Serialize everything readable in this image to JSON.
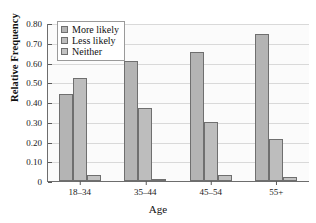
{
  "chart_data": {
    "type": "bar",
    "title": "",
    "xlabel": "Age",
    "ylabel": "Relative Frequency",
    "categories": [
      "18–34",
      "35–44",
      "45–54",
      "55+"
    ],
    "series": [
      {
        "name": "More likely",
        "values": [
          0.44,
          0.61,
          0.655,
          0.745
        ],
        "color": "#b4b4b4"
      },
      {
        "name": "Less likely",
        "values": [
          0.52,
          0.37,
          0.3,
          0.215
        ],
        "color": "#bdbdbd"
      },
      {
        "name": "Neither",
        "values": [
          0.03,
          0.01,
          0.03,
          0.02
        ],
        "color": "#c2c2c2"
      }
    ],
    "ylim": [
      0,
      0.8
    ],
    "ytick_labels": [
      "0",
      "0.10",
      "0.20",
      "0.30",
      "0.40",
      "0.50",
      "0.60",
      "0.70",
      "0.80"
    ],
    "ytick_values": [
      0,
      0.1,
      0.2,
      0.3,
      0.4,
      0.5,
      0.6,
      0.7,
      0.8
    ],
    "grid": true,
    "legend_position": "top-left"
  },
  "legend": {
    "items": [
      {
        "label": "More likely"
      },
      {
        "label": "Less likely"
      },
      {
        "label": "Neither"
      }
    ]
  }
}
